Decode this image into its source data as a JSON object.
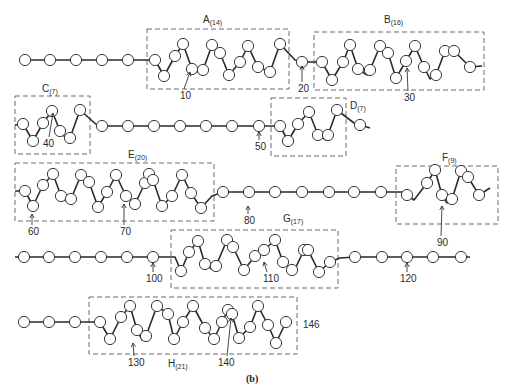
{
  "figure": {
    "caption": "(b)",
    "end_label": "146"
  },
  "helices": [
    {
      "name": "A",
      "count": "(14)",
      "box": [
        147,
        29,
        142,
        60
      ],
      "label_xy": [
        203,
        23
      ]
    },
    {
      "name": "B",
      "count": "(16)",
      "box": [
        314,
        32,
        170,
        58
      ],
      "label_xy": [
        384,
        23
      ]
    },
    {
      "name": "C",
      "count": "(7)",
      "box": [
        15,
        96,
        75,
        58
      ],
      "label_xy": [
        42,
        92
      ]
    },
    {
      "name": "D",
      "count": "(7)",
      "box": [
        271,
        98,
        75,
        58
      ],
      "label_xy": [
        350,
        109
      ]
    },
    {
      "name": "E",
      "count": "(20)",
      "box": [
        15,
        163,
        199,
        58
      ],
      "label_xy": [
        128,
        158
      ]
    },
    {
      "name": "F",
      "count": "(9)",
      "box": [
        396,
        166,
        102,
        58
      ],
      "label_xy": [
        442,
        161
      ]
    },
    {
      "name": "G",
      "count": "(17)",
      "box": [
        171,
        230,
        167,
        58
      ],
      "label_xy": [
        283,
        222
      ]
    },
    {
      "name": "H",
      "count": "(21)",
      "box": [
        89,
        297,
        208,
        57
      ],
      "label_xy": [
        168,
        367
      ]
    }
  ],
  "residue_markers": [
    {
      "label": "10",
      "text_xy": [
        180,
        99
      ],
      "arrow": [
        [
          184,
          89
        ],
        [
          190,
          72
        ]
      ]
    },
    {
      "label": "20",
      "text_xy": [
        298,
        92
      ],
      "arrow": [
        [
          302,
          82
        ],
        [
          302,
          66
        ]
      ]
    },
    {
      "label": "30",
      "text_xy": [
        404,
        101
      ],
      "arrow": [
        [
          408,
          91
        ],
        [
          407,
          68
        ]
      ]
    },
    {
      "label": "40",
      "text_xy": [
        43,
        147
      ],
      "arrow": [
        [
          49,
          137
        ],
        [
          53,
          113
        ]
      ]
    },
    {
      "label": "50",
      "text_xy": [
        255,
        150
      ],
      "arrow": [
        [
          259,
          140
        ],
        [
          259,
          132
        ]
      ]
    },
    {
      "label": "60",
      "text_xy": [
        28,
        235
      ],
      "arrow": [
        [
          32,
          225
        ],
        [
          32,
          214
        ]
      ]
    },
    {
      "label": "70",
      "text_xy": [
        120,
        235
      ],
      "arrow": [
        [
          124,
          225
        ],
        [
          124,
          204
        ]
      ]
    },
    {
      "label": "80",
      "text_xy": [
        244,
        224
      ],
      "arrow": [
        [
          248,
          214
        ],
        [
          248,
          206
        ]
      ]
    },
    {
      "label": "90",
      "text_xy": [
        437,
        246
      ],
      "arrow": [
        [
          441,
          236
        ],
        [
          442,
          206
        ]
      ]
    },
    {
      "label": "100",
      "text_xy": [
        146,
        282
      ],
      "arrow": [
        [
          153,
          272
        ],
        [
          153,
          263
        ]
      ]
    },
    {
      "label": "110",
      "text_xy": [
        263,
        282
      ],
      "arrow": [
        [
          267,
          272
        ],
        [
          264,
          262
        ]
      ]
    },
    {
      "label": "120",
      "text_xy": [
        400,
        282
      ],
      "arrow": [
        [
          407,
          272
        ],
        [
          407,
          263
        ]
      ]
    },
    {
      "label": "130",
      "text_xy": [
        128,
        366
      ],
      "arrow": [
        [
          134,
          356
        ],
        [
          133,
          343
        ]
      ]
    },
    {
      "label": "140",
      "text_xy": [
        218,
        366
      ],
      "arrow": [
        [
          227,
          356
        ],
        [
          231,
          318
        ]
      ]
    }
  ],
  "chains": [
    {
      "row": 1,
      "points": [
        [
          25,
          60
        ],
        [
          50,
          60
        ],
        [
          76,
          60
        ],
        [
          102,
          60
        ],
        [
          128,
          60
        ],
        [
          155,
          60
        ],
        [
          164,
          76
        ],
        [
          175,
          56
        ],
        [
          183,
          44
        ],
        [
          192,
          69
        ],
        [
          200,
          73
        ],
        [
          203,
          70
        ],
        [
          212,
          45
        ],
        [
          220,
          53
        ],
        [
          229,
          75
        ],
        [
          240,
          62
        ],
        [
          248,
          46
        ],
        [
          258,
          67
        ],
        [
          270,
          72
        ],
        [
          280,
          44
        ],
        [
          295,
          60
        ],
        [
          302,
          62
        ],
        [
          322,
          62
        ],
        [
          332,
          80
        ],
        [
          343,
          62
        ],
        [
          350,
          45
        ],
        [
          358,
          69
        ],
        [
          367,
          75
        ],
        [
          370,
          70
        ],
        [
          380,
          46
        ],
        [
          388,
          53
        ],
        [
          396,
          78
        ],
        [
          406,
          61
        ],
        [
          415,
          46
        ],
        [
          424,
          67
        ],
        [
          430,
          79
        ],
        [
          436,
          75
        ],
        [
          445,
          51
        ],
        [
          450,
          49
        ],
        [
          454,
          51
        ],
        [
          470,
          67
        ],
        [
          482,
          66
        ]
      ]
    },
    {
      "row": 2,
      "points": [
        [
          15,
          125
        ],
        [
          23,
          124
        ],
        [
          33,
          141
        ],
        [
          43,
          123
        ],
        [
          52,
          111
        ],
        [
          60,
          131
        ],
        [
          68,
          141
        ],
        [
          70,
          138
        ],
        [
          80,
          110
        ],
        [
          98,
          126
        ],
        [
          128,
          126
        ],
        [
          154,
          126
        ],
        [
          180,
          126
        ],
        [
          206,
          126
        ],
        [
          232,
          126
        ],
        [
          259,
          126
        ],
        [
          280,
          126
        ],
        [
          288,
          141
        ],
        [
          298,
          124
        ],
        [
          309,
          112
        ],
        [
          318,
          135
        ],
        [
          326,
          140
        ],
        [
          328,
          135
        ],
        [
          337,
          110
        ],
        [
          354,
          123
        ],
        [
          370,
          128
        ]
      ]
    },
    {
      "row": 3,
      "points": [
        [
          15,
          191
        ],
        [
          25,
          191
        ],
        [
          33,
          206
        ],
        [
          43,
          185
        ],
        [
          53,
          174
        ],
        [
          61,
          196
        ],
        [
          66,
          201
        ],
        [
          71,
          199
        ],
        [
          81,
          175
        ],
        [
          89,
          182
        ],
        [
          98,
          207
        ],
        [
          107,
          192
        ],
        [
          116,
          175
        ],
        [
          126,
          196
        ],
        [
          135,
          204
        ],
        [
          145,
          183
        ],
        [
          149,
          174
        ],
        [
          153,
          180
        ],
        [
          162,
          206
        ],
        [
          172,
          196
        ],
        [
          182,
          175
        ],
        [
          191,
          193
        ],
        [
          201,
          208
        ],
        [
          212,
          196
        ],
        [
          223,
          192
        ],
        [
          249,
          192
        ],
        [
          275,
          192
        ],
        [
          302,
          192
        ],
        [
          329,
          192
        ],
        [
          354,
          192
        ],
        [
          381,
          192
        ],
        [
          402,
          192
        ],
        [
          414,
          200
        ],
        [
          427,
          183
        ],
        [
          435,
          170
        ],
        [
          442,
          195
        ],
        [
          447,
          203
        ],
        [
          452,
          199
        ],
        [
          461,
          171
        ],
        [
          468,
          177
        ],
        [
          479,
          195
        ],
        [
          490,
          188
        ]
      ]
    },
    {
      "row": 4,
      "points": [
        [
          15,
          257
        ],
        [
          24,
          257
        ],
        [
          49,
          257
        ],
        [
          75,
          257
        ],
        [
          101,
          257
        ],
        [
          127,
          257
        ],
        [
          153,
          257
        ],
        [
          175,
          257
        ],
        [
          181,
          271
        ],
        [
          189,
          252
        ],
        [
          198,
          241
        ],
        [
          205,
          264
        ],
        [
          213,
          270
        ],
        [
          216,
          266
        ],
        [
          227,
          240
        ],
        [
          233,
          247
        ],
        [
          244,
          270
        ],
        [
          255,
          256
        ],
        [
          264,
          250
        ],
        [
          275,
          240
        ],
        [
          283,
          262
        ],
        [
          292,
          270
        ],
        [
          296,
          267
        ],
        [
          304,
          250
        ],
        [
          306,
          246
        ],
        [
          308,
          250
        ],
        [
          319,
          272
        ],
        [
          330,
          262
        ],
        [
          340,
          258
        ],
        [
          355,
          257
        ],
        [
          382,
          257
        ],
        [
          407,
          257
        ],
        [
          433,
          257
        ],
        [
          461,
          257
        ],
        [
          470,
          257
        ]
      ]
    },
    {
      "row": 5,
      "points": [
        [
          24,
          322
        ],
        [
          49,
          322
        ],
        [
          75,
          322
        ],
        [
          90,
          322
        ],
        [
          100,
          322
        ],
        [
          110,
          339
        ],
        [
          121,
          317
        ],
        [
          130,
          306
        ],
        [
          137,
          330
        ],
        [
          142,
          340
        ],
        [
          146,
          336
        ],
        [
          157,
          306
        ],
        [
          168,
          314
        ],
        [
          174,
          339
        ],
        [
          183,
          322
        ],
        [
          193,
          306
        ],
        [
          205,
          328
        ],
        [
          214,
          339
        ],
        [
          222,
          322
        ],
        [
          228,
          310
        ],
        [
          232,
          314
        ],
        [
          239,
          338
        ],
        [
          250,
          327
        ],
        [
          258,
          306
        ],
        [
          268,
          325
        ],
        [
          276,
          343
        ],
        [
          286,
          322
        ]
      ]
    }
  ],
  "nodes": [
    [
      25,
      60
    ],
    [
      50,
      60
    ],
    [
      76,
      60
    ],
    [
      102,
      60
    ],
    [
      128,
      60
    ],
    [
      155,
      60
    ],
    [
      164,
      76
    ],
    [
      175,
      56
    ],
    [
      183,
      44
    ],
    [
      192,
      69
    ],
    [
      203,
      70
    ],
    [
      212,
      45
    ],
    [
      220,
      53
    ],
    [
      229,
      75
    ],
    [
      240,
      62
    ],
    [
      248,
      46
    ],
    [
      258,
      67
    ],
    [
      270,
      72
    ],
    [
      280,
      44
    ],
    [
      302,
      62
    ],
    [
      322,
      62
    ],
    [
      332,
      80
    ],
    [
      343,
      62
    ],
    [
      350,
      45
    ],
    [
      358,
      69
    ],
    [
      370,
      70
    ],
    [
      380,
      46
    ],
    [
      388,
      53
    ],
    [
      396,
      78
    ],
    [
      406,
      61
    ],
    [
      415,
      46
    ],
    [
      424,
      67
    ],
    [
      436,
      75
    ],
    [
      445,
      51
    ],
    [
      454,
      51
    ],
    [
      470,
      67
    ],
    [
      23,
      124
    ],
    [
      33,
      141
    ],
    [
      43,
      123
    ],
    [
      52,
      111
    ],
    [
      60,
      131
    ],
    [
      70,
      138
    ],
    [
      80,
      110
    ],
    [
      102,
      126
    ],
    [
      128,
      126
    ],
    [
      154,
      126
    ],
    [
      180,
      126
    ],
    [
      206,
      126
    ],
    [
      232,
      126
    ],
    [
      259,
      126
    ],
    [
      280,
      126
    ],
    [
      288,
      141
    ],
    [
      298,
      124
    ],
    [
      309,
      112
    ],
    [
      318,
      135
    ],
    [
      328,
      135
    ],
    [
      337,
      110
    ],
    [
      360,
      125
    ],
    [
      25,
      191
    ],
    [
      33,
      206
    ],
    [
      43,
      185
    ],
    [
      53,
      174
    ],
    [
      61,
      196
    ],
    [
      71,
      199
    ],
    [
      81,
      175
    ],
    [
      89,
      182
    ],
    [
      98,
      207
    ],
    [
      107,
      192
    ],
    [
      116,
      175
    ],
    [
      126,
      196
    ],
    [
      135,
      204
    ],
    [
      145,
      183
    ],
    [
      149,
      174
    ],
    [
      153,
      180
    ],
    [
      162,
      206
    ],
    [
      172,
      196
    ],
    [
      182,
      175
    ],
    [
      191,
      193
    ],
    [
      201,
      208
    ],
    [
      223,
      192
    ],
    [
      249,
      192
    ],
    [
      275,
      192
    ],
    [
      302,
      192
    ],
    [
      329,
      192
    ],
    [
      354,
      192
    ],
    [
      381,
      192
    ],
    [
      407,
      195
    ],
    [
      427,
      183
    ],
    [
      435,
      170
    ],
    [
      442,
      195
    ],
    [
      452,
      199
    ],
    [
      461,
      171
    ],
    [
      468,
      177
    ],
    [
      479,
      195
    ],
    [
      24,
      257
    ],
    [
      49,
      257
    ],
    [
      75,
      257
    ],
    [
      101,
      257
    ],
    [
      127,
      257
    ],
    [
      153,
      257
    ],
    [
      181,
      271
    ],
    [
      189,
      252
    ],
    [
      198,
      241
    ],
    [
      205,
      264
    ],
    [
      216,
      266
    ],
    [
      227,
      240
    ],
    [
      233,
      247
    ],
    [
      244,
      270
    ],
    [
      255,
      256
    ],
    [
      264,
      250
    ],
    [
      275,
      240
    ],
    [
      283,
      262
    ],
    [
      292,
      270
    ],
    [
      304,
      250
    ],
    [
      308,
      250
    ],
    [
      319,
      272
    ],
    [
      330,
      262
    ],
    [
      355,
      257
    ],
    [
      382,
      257
    ],
    [
      407,
      257
    ],
    [
      433,
      257
    ],
    [
      461,
      257
    ],
    [
      24,
      322
    ],
    [
      49,
      322
    ],
    [
      75,
      322
    ],
    [
      100,
      322
    ],
    [
      110,
      339
    ],
    [
      121,
      317
    ],
    [
      130,
      306
    ],
    [
      137,
      330
    ],
    [
      146,
      336
    ],
    [
      157,
      306
    ],
    [
      168,
      314
    ],
    [
      174,
      339
    ],
    [
      183,
      322
    ],
    [
      193,
      306
    ],
    [
      205,
      328
    ],
    [
      214,
      339
    ],
    [
      222,
      322
    ],
    [
      228,
      310
    ],
    [
      232,
      314
    ],
    [
      239,
      338
    ],
    [
      250,
      327
    ],
    [
      258,
      306
    ],
    [
      268,
      325
    ],
    [
      276,
      343
    ],
    [
      286,
      322
    ]
  ]
}
